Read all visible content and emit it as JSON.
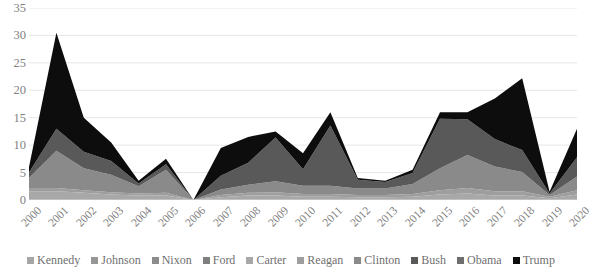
{
  "chart_data": {
    "type": "area",
    "stacked": true,
    "title": "",
    "xlabel": "",
    "ylabel": "",
    "ylim": [
      0,
      35
    ],
    "ytick_step": 5,
    "yticks": [
      35,
      30,
      25,
      20,
      15,
      10,
      5,
      0
    ],
    "grid": true,
    "legend_position": "bottom",
    "categories": [
      "2000",
      "2001",
      "2002",
      "2003",
      "2004",
      "2005",
      "2006",
      "2007",
      "2008",
      "2009",
      "2010",
      "2011",
      "2012",
      "2013",
      "2014",
      "2015",
      "2016",
      "2017",
      "2018",
      "2019",
      "2020"
    ],
    "series": [
      {
        "name": "Kennedy",
        "color": "#a6a6a6",
        "values": [
          0,
          0,
          0,
          0,
          0,
          0,
          0,
          0,
          0,
          0,
          0,
          0,
          0,
          0,
          0,
          0,
          0,
          0,
          0,
          0,
          0
        ]
      },
      {
        "name": "Johnson",
        "color": "#969696",
        "values": [
          0,
          0,
          0,
          0,
          0,
          0,
          0,
          0,
          0,
          0,
          0,
          0,
          0,
          0,
          0,
          0,
          0,
          0,
          0,
          0,
          0
        ]
      },
      {
        "name": "Nixon",
        "color": "#8c8c8c",
        "values": [
          0,
          0,
          0,
          0,
          0,
          0,
          0,
          0,
          0,
          0,
          0,
          0,
          0,
          0,
          0,
          0,
          0,
          0,
          0,
          0,
          0
        ]
      },
      {
        "name": "Ford",
        "color": "#7f7f7f",
        "values": [
          0,
          0,
          0,
          0,
          0,
          0,
          0,
          0,
          0,
          0,
          0,
          0,
          0,
          0,
          0,
          0,
          0,
          0,
          0,
          0,
          0
        ]
      },
      {
        "name": "Carter",
        "color": "#a8a8a8",
        "values": [
          1.6,
          1.6,
          1.3,
          1.0,
          0.8,
          0.8,
          0,
          0.5,
          0.8,
          0.8,
          0.6,
          0.6,
          0.5,
          0.5,
          0.6,
          1.0,
          1.2,
          0.8,
          0.8,
          0.3,
          1.0
        ]
      },
      {
        "name": "Reagan",
        "color": "#9e9e9e",
        "values": [
          0.6,
          0.6,
          0.5,
          0.4,
          0.4,
          0.5,
          0,
          0.4,
          0.5,
          0.6,
          0.5,
          0.5,
          0.4,
          0.4,
          0.5,
          0.8,
          1.0,
          0.8,
          0.8,
          0.3,
          0.8
        ]
      },
      {
        "name": "Clinton",
        "color": "#8a8a8a",
        "values": [
          1.8,
          6.8,
          4.0,
          3.2,
          1.3,
          4.2,
          0,
          1.0,
          1.5,
          2.0,
          1.5,
          1.5,
          1.2,
          1.2,
          1.8,
          4.0,
          6.0,
          4.5,
          3.5,
          0.3,
          2.5
        ]
      },
      {
        "name": "Bush",
        "color": "#595959",
        "values": [
          1.0,
          4.0,
          3.0,
          2.5,
          0.5,
          1.0,
          0,
          2.5,
          4.0,
          8.0,
          3.0,
          11.0,
          1.6,
          1.2,
          2.0,
          9.0,
          6.5,
          5.0,
          4.0,
          0.3,
          3.5
        ]
      },
      {
        "name": "Obama",
        "color": "#6e6e6e",
        "values": [
          0,
          0,
          0,
          0,
          0,
          0,
          0,
          0,
          0,
          0,
          0,
          0,
          0,
          0,
          0,
          0,
          0,
          0,
          0,
          0,
          0
        ]
      },
      {
        "name": "Trump",
        "color": "#0d0d0d",
        "values": [
          1.0,
          17.5,
          6.2,
          3.4,
          0.5,
          1.0,
          0,
          5.1,
          4.7,
          1.1,
          2.9,
          2.4,
          0.3,
          0.2,
          0.6,
          1.2,
          1.3,
          7.4,
          13.1,
          0.3,
          5.2
        ]
      }
    ],
    "totals": [
      6.0,
      30.5,
      15.0,
      10.5,
      3.5,
      7.5,
      0.0,
      9.5,
      11.5,
      12.5,
      8.5,
      16.0,
      4.0,
      3.5,
      5.5,
      16.0,
      16.0,
      18.5,
      22.2,
      1.5,
      13.0
    ]
  },
  "legend": {
    "items": [
      {
        "label": "Kennedy",
        "color": "#a6a6a6"
      },
      {
        "label": "Johnson",
        "color": "#969696"
      },
      {
        "label": "Nixon",
        "color": "#8c8c8c"
      },
      {
        "label": "Ford",
        "color": "#7f7f7f"
      },
      {
        "label": "Carter",
        "color": "#a8a8a8"
      },
      {
        "label": "Reagan",
        "color": "#9e9e9e"
      },
      {
        "label": "Clinton",
        "color": "#8a8a8a"
      },
      {
        "label": "Bush",
        "color": "#595959"
      },
      {
        "label": "Obama",
        "color": "#6e6e6e"
      },
      {
        "label": "Trump",
        "color": "#0d0d0d"
      }
    ]
  },
  "colors": {
    "grid": "#e6e6e6",
    "axis_text": "#7f7f7f",
    "background": "#ffffff"
  }
}
